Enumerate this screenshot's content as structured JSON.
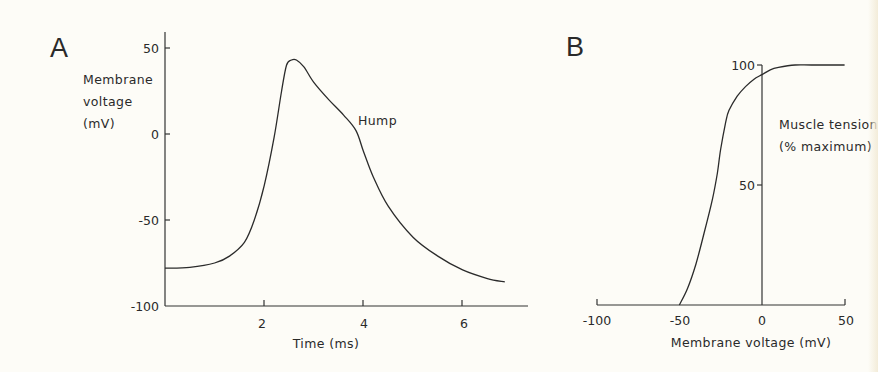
{
  "panels": {
    "A": {
      "letter": "A",
      "ylabel_lines": [
        "Membrane",
        "voltage",
        "(mV)"
      ],
      "xlabel": "Time (ms)",
      "yticks": [
        "50",
        "0",
        "-50",
        "-100"
      ],
      "xticks": [
        "2",
        "4",
        "6"
      ],
      "annotation": "Hump"
    },
    "B": {
      "letter": "B",
      "ylabel_lines": [
        "Muscle tension",
        "(% maximum)"
      ],
      "xlabel": "Membrane  voltage  (mV)",
      "yticks": [
        "100",
        "50"
      ],
      "xticks": [
        "-100",
        "-50",
        "0",
        "50"
      ]
    }
  },
  "colors": {
    "ink": "#2b2b2b",
    "paper": "#fdfcf7"
  },
  "chart_data": [
    {
      "panel": "A",
      "type": "line",
      "title": "",
      "xlabel": "Time (ms)",
      "ylabel": "Membrane voltage (mV)",
      "xlim": [
        0,
        7.3
      ],
      "ylim": [
        -100,
        55
      ],
      "xticks": [
        2,
        4,
        6
      ],
      "yticks": [
        -100,
        -50,
        0,
        50
      ],
      "grid": false,
      "annotations": [
        {
          "text": "Hump",
          "x": 4.0,
          "y": 12
        }
      ],
      "series": [
        {
          "name": "Muscle action potential",
          "x": [
            0.0,
            0.5,
            1.0,
            1.3,
            1.6,
            1.8,
            2.0,
            2.2,
            2.35,
            2.45,
            2.55,
            2.65,
            2.8,
            3.0,
            3.3,
            3.6,
            3.85,
            4.0,
            4.2,
            4.5,
            5.0,
            5.5,
            6.0,
            6.5,
            6.85
          ],
          "y": [
            -78,
            -77.5,
            -75,
            -71,
            -63,
            -50,
            -30,
            -2,
            25,
            40,
            43,
            43,
            39,
            30,
            20,
            11,
            2,
            -10,
            -25,
            -42,
            -60,
            -71,
            -79,
            -84,
            -86
          ]
        }
      ]
    },
    {
      "panel": "B",
      "type": "line",
      "title": "",
      "xlabel": "Membrane voltage (mV)",
      "ylabel": "Muscle tension (% maximum)",
      "xlim": [
        -100,
        50
      ],
      "ylim": [
        0,
        100
      ],
      "xticks": [
        -100,
        -50,
        0,
        50
      ],
      "yticks": [
        50,
        100
      ],
      "grid": false,
      "series": [
        {
          "name": "Tension vs voltage",
          "x": [
            -50,
            -45,
            -40,
            -35,
            -30,
            -27,
            -25,
            -22,
            -20,
            -15,
            -10,
            -5,
            0,
            5,
            10,
            20,
            30,
            50
          ],
          "y": [
            0,
            7,
            17,
            30,
            44,
            55,
            65,
            76,
            81,
            87,
            91,
            94,
            96,
            98,
            99,
            100,
            100,
            100
          ]
        }
      ]
    }
  ]
}
